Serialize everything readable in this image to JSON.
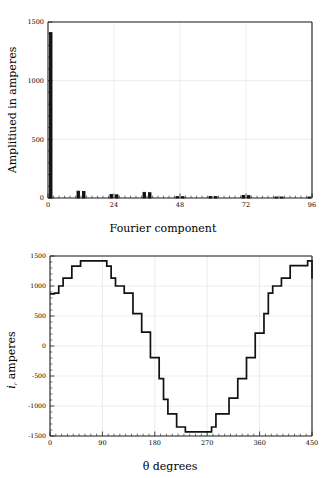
{
  "figure": {
    "background": "#ffffff",
    "ink": "#111111",
    "grid_color": "#d9d9d9"
  },
  "chart_data": [
    {
      "id": "fourier-spectrum",
      "type": "bar",
      "title": "",
      "xlabel": "Fourier component",
      "ylabel": "Amplitiued in amperes",
      "xlim": [
        0,
        96
      ],
      "ylim": [
        0,
        1500
      ],
      "xticks": [
        0,
        24,
        48,
        72,
        96
      ],
      "xtick_labels": [
        "0",
        "24",
        "48",
        "72",
        "96"
      ],
      "yticks": [
        0,
        500,
        1000,
        1500
      ],
      "ytick_labels": [
        "0",
        "500",
        "1000",
        "1500"
      ],
      "x_minor_tick_step": 2,
      "y_minor_tick_step": 100,
      "grid": true,
      "legend": "none",
      "bar_width": 0.9,
      "categories": [
        1,
        11,
        13,
        23,
        25,
        35,
        37,
        47,
        49,
        59,
        61,
        71,
        73,
        83,
        85,
        95
      ],
      "values": [
        1410,
        58,
        56,
        30,
        27,
        48,
        45,
        12,
        11,
        13,
        12,
        21,
        20,
        6,
        6,
        5
      ],
      "series_name": "harmonic amplitude"
    },
    {
      "id": "stepped-current-waveform",
      "type": "line",
      "title": "",
      "xlabel": "θ degrees",
      "ylabel": "i_r amperes",
      "ylabel_base": "i",
      "ylabel_sub": "r",
      "ylabel_rest": " amperes",
      "xlim": [
        0,
        450
      ],
      "ylim": [
        -1500,
        1500
      ],
      "xticks": [
        0,
        90,
        180,
        270,
        360,
        450
      ],
      "xtick_labels": [
        "0",
        "90",
        "180",
        "270",
        "360",
        "450"
      ],
      "yticks": [
        -1500,
        -1000,
        -500,
        0,
        500,
        1000,
        1500
      ],
      "ytick_labels": [
        "-1500",
        "-1000",
        "-500",
        "0",
        "500",
        "1000",
        "1500"
      ],
      "x_minor_tick_step": 10,
      "y_minor_tick_step": 100,
      "grid": true,
      "legend": "none",
      "series_name": "i_r stepped current",
      "step_x": [
        0,
        7.5,
        15,
        22.5,
        37.5,
        52.5,
        82.5,
        97.5,
        105,
        112.5,
        127.5,
        142.5,
        150,
        157.5,
        172.5,
        180,
        187.5,
        195,
        202.5,
        217.5,
        232.5,
        262.5,
        277.5,
        285,
        292.5,
        307.5,
        322.5,
        330,
        337.5,
        352.5,
        360,
        367.5,
        375,
        382.5,
        397.5,
        412.5,
        442.5,
        450
      ],
      "step_y": [
        870,
        880,
        1000,
        1130,
        1330,
        1420,
        1420,
        1330,
        1130,
        1000,
        880,
        540,
        540,
        230,
        -195,
        -195,
        -545,
        -890,
        -1130,
        -1350,
        -1430,
        -1430,
        -1350,
        -1130,
        -1130,
        -870,
        -545,
        -545,
        -195,
        215,
        215,
        540,
        880,
        1000,
        1130,
        1340,
        1420,
        1120
      ]
    }
  ]
}
